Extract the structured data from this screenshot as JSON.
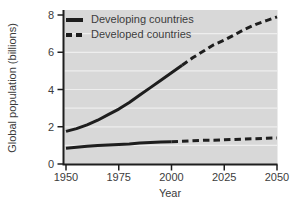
{
  "chart_data": {
    "type": "line",
    "title": "",
    "xlabel": "Year",
    "ylabel": "Global population (billions)",
    "x_range": [
      1950,
      2050
    ],
    "y_range": [
      0,
      8
    ],
    "x_ticks": [
      "1950",
      "1975",
      "2000",
      "2025",
      "2050"
    ],
    "y_ticks": [
      "0",
      "2",
      "4",
      "6",
      "8"
    ],
    "gridline_values": [
      1,
      2,
      3,
      4,
      5,
      6,
      7
    ],
    "grid": "horizontal",
    "legend_position": "top-left-inside",
    "colors": {
      "plot_background": "#d8d8d8",
      "gridline": "#eeeeee",
      "line": "#1e1e1e",
      "axis": "#1e1e1e",
      "text": "#3c3c3c"
    },
    "series": [
      {
        "name": "Developing countries",
        "legend_swatch": "solid",
        "line_style": "solid-then-dashed",
        "solid_until_year": 2005,
        "points": [
          [
            1950,
            1.75
          ],
          [
            1955,
            1.9
          ],
          [
            1960,
            2.1
          ],
          [
            1965,
            2.35
          ],
          [
            1970,
            2.65
          ],
          [
            1975,
            2.95
          ],
          [
            1980,
            3.3
          ],
          [
            1985,
            3.7
          ],
          [
            1990,
            4.1
          ],
          [
            1995,
            4.5
          ],
          [
            2000,
            4.9
          ],
          [
            2005,
            5.3
          ],
          [
            2010,
            5.7
          ],
          [
            2015,
            6.05
          ],
          [
            2020,
            6.4
          ],
          [
            2025,
            6.65
          ],
          [
            2030,
            6.95
          ],
          [
            2035,
            7.25
          ],
          [
            2040,
            7.5
          ],
          [
            2045,
            7.7
          ],
          [
            2050,
            7.9
          ]
        ]
      },
      {
        "name": "Developed countries",
        "legend_swatch": "dashed",
        "line_style": "solid-then-dashed",
        "solid_until_year": 2000,
        "points": [
          [
            1950,
            0.85
          ],
          [
            1955,
            0.9
          ],
          [
            1960,
            0.95
          ],
          [
            1965,
            1.0
          ],
          [
            1970,
            1.02
          ],
          [
            1975,
            1.05
          ],
          [
            1980,
            1.08
          ],
          [
            1985,
            1.12
          ],
          [
            1990,
            1.15
          ],
          [
            1995,
            1.18
          ],
          [
            2000,
            1.2
          ],
          [
            2005,
            1.22
          ],
          [
            2010,
            1.25
          ],
          [
            2015,
            1.27
          ],
          [
            2020,
            1.28
          ],
          [
            2025,
            1.3
          ],
          [
            2030,
            1.32
          ],
          [
            2035,
            1.34
          ],
          [
            2040,
            1.36
          ],
          [
            2045,
            1.38
          ],
          [
            2050,
            1.4
          ]
        ]
      }
    ]
  }
}
